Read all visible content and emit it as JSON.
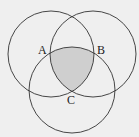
{
  "diagram": {
    "type": "venn-three-circles",
    "background": "#efefef",
    "stroke": "#333333",
    "shade_fill": "#cfcfcf",
    "circles": [
      {
        "name": "left",
        "cx": 51,
        "cy": 54,
        "r": 43
      },
      {
        "name": "right",
        "cx": 93,
        "cy": 54,
        "r": 43
      },
      {
        "name": "bottom",
        "cx": 72,
        "cy": 90,
        "r": 43
      }
    ],
    "labels": {
      "a": "A",
      "b": "B",
      "c": "C"
    },
    "shaded_region": "intersection of all three circles"
  }
}
